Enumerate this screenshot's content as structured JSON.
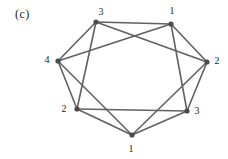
{
  "figure": {
    "label": "(c)"
  },
  "colors": {
    "background": "#ffffff",
    "edge": "#616161",
    "vertex_dot": "#4c4c4c",
    "label_text": "#1d1d1d"
  },
  "style": {
    "edge_width": 1.6,
    "dot_radius": 2.6
  },
  "graph": {
    "vertices": [
      {
        "id": "top-left",
        "label": "3",
        "x": 96,
        "y": 22,
        "lx": 101,
        "ly": 15
      },
      {
        "id": "top-right",
        "label": "1",
        "x": 171,
        "y": 24,
        "lx": 172,
        "ly": 14
      },
      {
        "id": "left",
        "label": "4",
        "x": 58,
        "y": 61,
        "lx": 47,
        "ly": 63
      },
      {
        "id": "right",
        "label": "2",
        "x": 207,
        "y": 62,
        "lx": 217,
        "ly": 64
      },
      {
        "id": "bottom-left",
        "label": "2",
        "x": 77,
        "y": 109,
        "lx": 64,
        "ly": 112
      },
      {
        "id": "bottom-right",
        "label": "3",
        "x": 187,
        "y": 111,
        "lx": 197,
        "ly": 114
      },
      {
        "id": "bottom",
        "label": "1",
        "x": 132,
        "y": 135,
        "lx": 131,
        "ly": 152
      }
    ],
    "edges": [
      [
        "left",
        "top-left"
      ],
      [
        "top-left",
        "top-right"
      ],
      [
        "top-right",
        "right"
      ],
      [
        "right",
        "bottom-right"
      ],
      [
        "bottom-right",
        "bottom"
      ],
      [
        "bottom",
        "bottom-left"
      ],
      [
        "bottom-left",
        "left"
      ],
      [
        "top-left",
        "right"
      ],
      [
        "top-right",
        "left"
      ],
      [
        "top-right",
        "bottom-right"
      ],
      [
        "top-left",
        "bottom-left"
      ],
      [
        "left",
        "bottom"
      ],
      [
        "right",
        "bottom"
      ],
      [
        "bottom-left",
        "bottom-right"
      ]
    ]
  }
}
